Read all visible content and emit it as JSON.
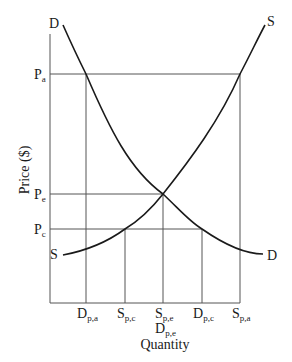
{
  "diagram": {
    "type": "supply-demand",
    "y_axis_label": "Price ($)",
    "x_axis_label": "Quantity",
    "curves": {
      "demand": {
        "label_top": "D",
        "label_bottom": "D"
      },
      "supply": {
        "label_top": "S",
        "label_bottom": "S"
      }
    },
    "price_levels": [
      {
        "main": "P",
        "sub": "a"
      },
      {
        "main": "P",
        "sub": "e"
      },
      {
        "main": "P",
        "sub": "c"
      }
    ],
    "quantity_levels": [
      {
        "main": "D",
        "sub": "p,a"
      },
      {
        "main": "S",
        "sub": "p,c"
      },
      {
        "main": "S",
        "sub": "p,e"
      },
      {
        "main": "D",
        "sub": "p,c"
      },
      {
        "main": "S",
        "sub": "p,a"
      }
    ],
    "quantity_extra": {
      "main": "D",
      "sub": "p,e"
    }
  },
  "colors": {
    "line": "#1a1a1a",
    "grid": "#555555",
    "background": "#ffffff"
  }
}
